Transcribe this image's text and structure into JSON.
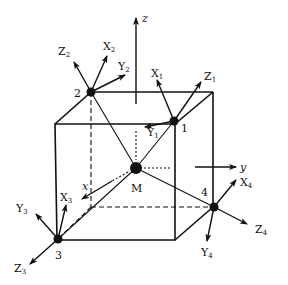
{
  "diagram": {
    "title": "",
    "global_axes": {
      "x": "x",
      "y": "y",
      "z": "z"
    },
    "center": {
      "label": "M"
    },
    "vertices": [
      {
        "id": "1",
        "label": "1",
        "axes": {
          "X": "X",
          "X_sub": "1",
          "Y": "Y",
          "Y_sub": "1",
          "Z": "Z",
          "Z_sub": "1"
        }
      },
      {
        "id": "2",
        "label": "2",
        "axes": {
          "X": "X",
          "X_sub": "2",
          "Y": "Y",
          "Y_sub": "2",
          "Z": "Z",
          "Z_sub": "2"
        }
      },
      {
        "id": "3",
        "label": "3",
        "axes": {
          "X": "X",
          "X_sub": "3",
          "Y": "Y",
          "Y_sub": "3",
          "Z": "Z",
          "Z_sub": "3"
        }
      },
      {
        "id": "4",
        "label": "4",
        "axes": {
          "X": "X",
          "X_sub": "4",
          "Y": "Y",
          "Y_sub": "4",
          "Z": "Z",
          "Z_sub": "4"
        }
      }
    ],
    "colors": {
      "ink": "#111111",
      "background": "#ffffff"
    }
  }
}
